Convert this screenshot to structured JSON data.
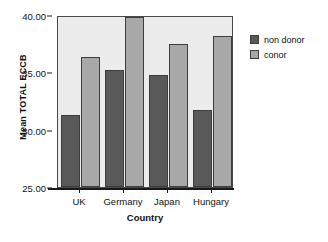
{
  "chart_data": {
    "type": "bar",
    "title": "",
    "subtitle": "",
    "xlabel": "Country",
    "ylabel": "Mean TOTAL ECCB",
    "categories": [
      "UK",
      "Germany",
      "Japan",
      "Hungary"
    ],
    "series": [
      {
        "name": "non donor",
        "color": "#595959",
        "values": [
          31.3,
          35.2,
          34.8,
          31.7
        ]
      },
      {
        "name": "conor",
        "color": "#a8a8a8",
        "values": [
          36.3,
          39.8,
          37.5,
          38.2
        ]
      }
    ],
    "ylim": [
      25.0,
      40.0
    ],
    "yticks": [
      25.0,
      30.0,
      35.0,
      40.0
    ],
    "ytick_labels": [
      "25.00",
      "30.00",
      "35.00",
      "40.00"
    ],
    "grid": false,
    "legend_position": "right",
    "plot_background": "#ececec",
    "frame_color": "#4a4a4a"
  }
}
